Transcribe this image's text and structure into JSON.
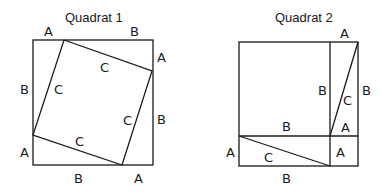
{
  "diagram": {
    "quadrat1": {
      "title": "Quadrat 1",
      "labels": {
        "top_left": "A",
        "top_right": "B",
        "right_top": "A",
        "right_bottom": "B",
        "bottom_left": "B",
        "bottom_right": "A",
        "left_top": "B",
        "left_bottom": "A",
        "inner_top": "C",
        "inner_right": "C",
        "inner_bottom": "C",
        "inner_left": "C"
      }
    },
    "quadrat2": {
      "title": "Quadrat 2",
      "labels": {
        "top_right": "A",
        "right": "B",
        "inner_vertical": "B",
        "diagonal_upper": "C",
        "strip_a": "A",
        "middle_horizontal": "B",
        "left_bottom": "A",
        "diagonal_lower": "C",
        "corner_a": "A",
        "bottom": "B"
      }
    },
    "stroke_color": "#1a1a1a",
    "background": "#ffffff"
  }
}
